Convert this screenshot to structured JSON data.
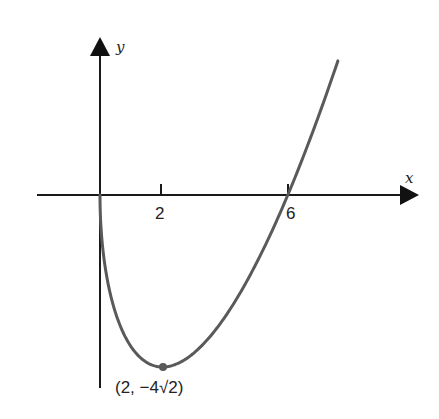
{
  "chart_data": {
    "type": "line",
    "title": "",
    "xlabel": "x",
    "ylabel": "y",
    "function": "y = sqrt(x) * (x - 6)",
    "x_ticks": [
      2,
      6
    ],
    "x_tick_labels": [
      "2",
      "6"
    ],
    "xlim": [
      -2,
      10
    ],
    "ylim": [
      -6.3,
      5
    ],
    "grid": false,
    "legend": null,
    "series": [
      {
        "name": "curve",
        "x": [
          0,
          0.25,
          0.5,
          1,
          1.5,
          2,
          3,
          4,
          5,
          6,
          7,
          7.6
        ],
        "values": [
          0,
          -2.875,
          -3.889,
          -5.0,
          -5.511,
          -5.657,
          -5.196,
          -4.0,
          -2.236,
          0,
          2.646,
          4.41
        ]
      }
    ],
    "annotations": [
      {
        "x": 2,
        "y": -5.657,
        "label": "(2, −4√2)",
        "marker": "dot"
      }
    ],
    "colors": {
      "axis": "#1a1a1a",
      "curve": "#5a5a5a",
      "text": "#222222"
    }
  },
  "labels": {
    "x_axis": "x",
    "y_axis": "y",
    "tick_2": "2",
    "tick_6": "6",
    "min_point": "(2, −4√2)"
  }
}
